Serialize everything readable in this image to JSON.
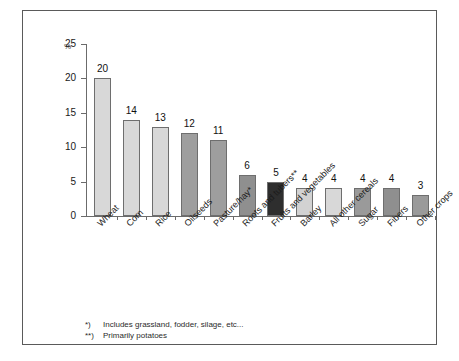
{
  "chart_data": {
    "type": "bar",
    "title": "",
    "xlabel": "",
    "ylabel": "%",
    "ylim": [
      0,
      25
    ],
    "yticks": [
      0,
      5,
      10,
      15,
      20,
      25
    ],
    "grid": false,
    "legend": "none",
    "categories": [
      "Wheat",
      "Corn",
      "Rice",
      "Oilseeds",
      "Pasture/hay*",
      "Roots and tubers**",
      "Fruits and vegetables",
      "Barley",
      "All other cereals",
      "Sugar",
      "Fibers",
      "Other crops"
    ],
    "values": [
      20,
      14,
      13,
      12,
      11,
      6,
      5,
      4,
      4,
      4,
      4,
      3
    ],
    "bar_colors": [
      "#d8d8d8",
      "#d8d8d8",
      "#d8d8d8",
      "#9e9e9e",
      "#9e9e9e",
      "#8f8f8f",
      "#2e2e2e",
      "#d2d2d2",
      "#d8d8d8",
      "#9a9a9a",
      "#8f8f8f",
      "#9a9a9a"
    ]
  },
  "axis": {
    "unit_label": "%"
  },
  "footnotes": [
    {
      "mark": "*)",
      "text": "Includes grassland, fodder, silage, etc..."
    },
    {
      "mark": "**)",
      "text": "Primarily potatoes"
    }
  ]
}
